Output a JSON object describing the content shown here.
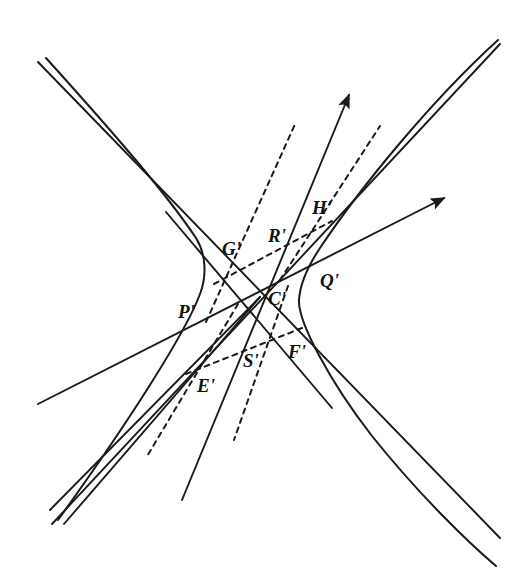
{
  "figure": {
    "background_color": "#ffffff",
    "stroke_color": "#1a1a1a",
    "width": 531,
    "height": 576
  },
  "labels": [
    {
      "id": "G",
      "text": "G'",
      "x": 222,
      "y": 255
    },
    {
      "id": "R",
      "text": "R'",
      "x": 268,
      "y": 242
    },
    {
      "id": "H",
      "text": "H'",
      "x": 312,
      "y": 214
    },
    {
      "id": "Q",
      "text": "Q'",
      "x": 320,
      "y": 287
    },
    {
      "id": "C",
      "text": "C'",
      "x": 268,
      "y": 305
    },
    {
      "id": "P",
      "text": "P'",
      "x": 178,
      "y": 318
    },
    {
      "id": "F",
      "text": "F'",
      "x": 288,
      "y": 358
    },
    {
      "id": "S",
      "text": "S'",
      "x": 243,
      "y": 367
    },
    {
      "id": "E",
      "text": "E'",
      "x": 197,
      "y": 392
    }
  ],
  "points": {
    "center": {
      "name": "C-prime",
      "x": 260,
      "y": 297
    },
    "left_vertex": {
      "name": "left-branch-vertex",
      "x": 204,
      "y": 266
    },
    "right_vertex": {
      "name": "right-branch-vertex",
      "x": 300,
      "y": 296
    },
    "G_point": {
      "name": "G-prime-point",
      "x": 243,
      "y": 268
    },
    "H_point": {
      "name": "H-prime-point",
      "x": 320,
      "y": 230
    },
    "Q_point": {
      "name": "Q-prime-point",
      "x": 313,
      "y": 274
    },
    "P_point": {
      "name": "P-prime-point",
      "x": 202,
      "y": 314
    },
    "E_point": {
      "name": "E-prime-point",
      "x": 203,
      "y": 364
    },
    "S_point": {
      "name": "S-prime-point",
      "x": 248,
      "y": 350
    },
    "F_point": {
      "name": "F-prime-point",
      "x": 282,
      "y": 338
    }
  },
  "asymptotes": [
    {
      "name": "asymptote-nw-se",
      "x1": 38,
      "y1": 62,
      "x2": 500,
      "y2": 538
    },
    {
      "name": "asymptote-sw-ne",
      "x1": 52,
      "y1": 524,
      "x2": 500,
      "y2": 44
    }
  ],
  "arrows": [
    {
      "name": "arrow-ray-steep",
      "x1": 182,
      "y1": 500,
      "x2": 351,
      "y2": 92,
      "tip_x": 351,
      "tip_y": 92
    },
    {
      "name": "arrow-ray-shallow",
      "x1": 38,
      "y1": 404,
      "x2": 447,
      "y2": 196,
      "tip_x": 447,
      "tip_y": 196
    }
  ],
  "solid_lines": [
    {
      "name": "chord-G-prime-through-center",
      "x1": 168,
      "y1": 214,
      "x2": 330,
      "y2": 405
    },
    {
      "name": "line-center-to-lower-left",
      "x1": 260,
      "y1": 297,
      "x2": 52,
      "y2": 512
    },
    {
      "name": "line-center-to-lower-left-2",
      "x1": 260,
      "y1": 297,
      "x2": 66,
      "y2": 524
    }
  ],
  "dashed_lines": [
    {
      "name": "dashed-tangent-G-to-H",
      "x1": 216,
      "y1": 282,
      "x2": 330,
      "y2": 222
    },
    {
      "name": "dashed-diameter-upper",
      "x1": 207,
      "y1": 320,
      "x2": 294,
      "y2": 124
    },
    {
      "name": "dashed-diameter-lower",
      "x1": 286,
      "y1": 288,
      "x2": 236,
      "y2": 438
    },
    {
      "name": "dashed-chord-E-to-F",
      "x1": 188,
      "y1": 372,
      "x2": 300,
      "y2": 330
    },
    {
      "name": "dashed-ray-lower-left",
      "x1": 236,
      "y1": 306,
      "x2": 148,
      "y2": 456
    },
    {
      "name": "dashed-ray-upper-right",
      "x1": 278,
      "y1": 282,
      "x2": 378,
      "y2": 128
    }
  ],
  "hyperbola": {
    "name": "hyperbola-conic",
    "left_branch_note": "opens up-left, vertex near P'/G' side",
    "right_branch_note": "opens down-right, vertex near Q'/F' side"
  }
}
